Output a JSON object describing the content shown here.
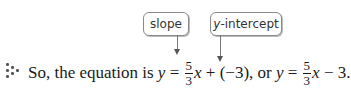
{
  "callouts": {
    "slope": "slope",
    "intercept_var": "y",
    "intercept_rest": "-intercept"
  },
  "icon": "dot-pattern-icon",
  "sentence": {
    "intro": "So, the equation is ",
    "var_y": "y",
    "equals": " = ",
    "numerator": "5",
    "denominator": "3",
    "var_x": "x",
    "plus_part": " + (−3), or ",
    "var_y2": "y",
    "equals2": " = ",
    "numerator2": "5",
    "denominator2": "3",
    "var_x2": "x",
    "minus_part": " − 3."
  },
  "colors": {
    "text": "#1a1a1a",
    "callout_border": "#8a8a8a",
    "arrow": "#777777"
  }
}
